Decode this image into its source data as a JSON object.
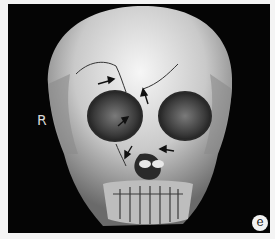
{
  "figure": {
    "panel_letter": "e",
    "side_label": "R",
    "annotations": {
      "arrow_count": 5,
      "arrow_color": "#111111",
      "arrows": [
        {
          "location": "right supraorbital / frontal bone fracture line"
        },
        {
          "location": "frontal bone glabella region fracture"
        },
        {
          "location": "right orbit medial wall"
        },
        {
          "location": "right nasal-maxillary fracture"
        },
        {
          "location": "nasal bone / piriform aperture fracture"
        }
      ]
    },
    "colors": {
      "background": "#050505",
      "bone": "#d9d9d9",
      "border": "#f4f4f4"
    }
  }
}
